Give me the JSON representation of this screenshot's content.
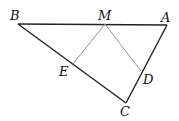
{
  "diagram": {
    "type": "geometry",
    "points": {
      "B": {
        "label": "B",
        "x": 18,
        "y": 24,
        "lx": 10,
        "ly": 20
      },
      "M": {
        "label": "M",
        "x": 105,
        "y": 24,
        "lx": 98,
        "ly": 20
      },
      "A": {
        "label": "A",
        "x": 167,
        "y": 25,
        "lx": 161,
        "ly": 22
      },
      "E": {
        "label": "E",
        "x": 73,
        "y": 64,
        "lx": 59,
        "ly": 76
      },
      "D": {
        "label": "D",
        "x": 141,
        "y": 71,
        "lx": 143,
        "ly": 84
      },
      "C": {
        "label": "C",
        "x": 126,
        "y": 103,
        "lx": 120,
        "ly": 116
      }
    },
    "segments": [
      {
        "from": "B",
        "to": "A",
        "style": "thick"
      },
      {
        "from": "B",
        "to": "C",
        "style": "thick"
      },
      {
        "from": "A",
        "to": "C",
        "style": "thick"
      },
      {
        "from": "M",
        "to": "E",
        "style": "thin"
      },
      {
        "from": "M",
        "to": "D",
        "style": "thin"
      }
    ],
    "colors": {
      "thick": "#222222",
      "thin": "#888888"
    }
  }
}
